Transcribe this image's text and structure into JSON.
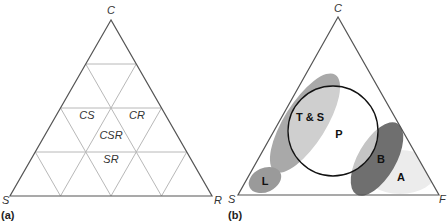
{
  "panel_a": {
    "label": "(a)",
    "vertices": {
      "top": "C",
      "left": "S",
      "right": "R"
    },
    "regions": {
      "cs": "CS",
      "cr": "CR",
      "csr": "CSR",
      "sr": "SR"
    },
    "grid_color": "#b8b8b8",
    "outline_color": "#555555"
  },
  "panel_b": {
    "label": "(b)",
    "vertices": {
      "top": "C",
      "left": "S",
      "right": "F"
    },
    "regions": {
      "ts": "T & S",
      "p": "P",
      "b": "B",
      "a": "A",
      "l": "L"
    },
    "colors": {
      "ts_fill": "#a9a9a9",
      "ts_inner_fill": "#cfcfcf",
      "l_fill": "#999999",
      "b_fill": "#6f6f6f",
      "b_inner_fill": "#c4c4c4",
      "a_fill": "#ececec",
      "circle_stroke": "#111111"
    }
  }
}
